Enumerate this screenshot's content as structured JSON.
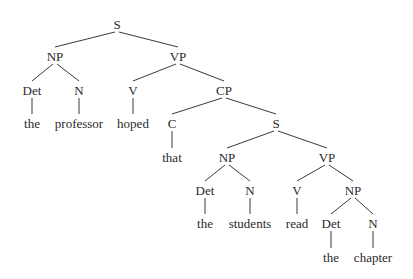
{
  "diagram": {
    "type": "syntax-tree",
    "sentence": "the professor hoped that the students read the chapter",
    "colors": {
      "text": "#2a2a2a",
      "edges": "#3a3a3a",
      "background": "#ffffff"
    },
    "nodes": [
      {
        "id": "S1",
        "label": "S",
        "x": 117,
        "y": 24
      },
      {
        "id": "NP1",
        "label": "NP",
        "x": 55,
        "y": 56
      },
      {
        "id": "VP1",
        "label": "VP",
        "x": 178,
        "y": 56
      },
      {
        "id": "Det1",
        "label": "Det",
        "x": 32,
        "y": 90
      },
      {
        "id": "N1",
        "label": "N",
        "x": 79,
        "y": 90
      },
      {
        "id": "V1",
        "label": "V",
        "x": 133,
        "y": 90
      },
      {
        "id": "CP1",
        "label": "CP",
        "x": 224,
        "y": 90
      },
      {
        "id": "w1",
        "label": "the",
        "x": 32,
        "y": 123
      },
      {
        "id": "w2",
        "label": "professor",
        "x": 79,
        "y": 123
      },
      {
        "id": "w3",
        "label": "hoped",
        "x": 133,
        "y": 123
      },
      {
        "id": "C1",
        "label": "C",
        "x": 172,
        "y": 123
      },
      {
        "id": "S2",
        "label": "S",
        "x": 276,
        "y": 123
      },
      {
        "id": "w4",
        "label": "that",
        "x": 172,
        "y": 157
      },
      {
        "id": "NP2",
        "label": "NP",
        "x": 227,
        "y": 157
      },
      {
        "id": "VP2",
        "label": "VP",
        "x": 327,
        "y": 157
      },
      {
        "id": "Det2",
        "label": "Det",
        "x": 205,
        "y": 190
      },
      {
        "id": "N2",
        "label": "N",
        "x": 250,
        "y": 190
      },
      {
        "id": "V2",
        "label": "V",
        "x": 297,
        "y": 190
      },
      {
        "id": "NP3",
        "label": "NP",
        "x": 353,
        "y": 190
      },
      {
        "id": "w5",
        "label": "the",
        "x": 205,
        "y": 223
      },
      {
        "id": "w6",
        "label": "students",
        "x": 250,
        "y": 223
      },
      {
        "id": "w7",
        "label": "read",
        "x": 297,
        "y": 223
      },
      {
        "id": "Det3",
        "label": "Det",
        "x": 331,
        "y": 223
      },
      {
        "id": "N3",
        "label": "N",
        "x": 373,
        "y": 223
      },
      {
        "id": "w8",
        "label": "the",
        "x": 331,
        "y": 257
      },
      {
        "id": "w9",
        "label": "chapter",
        "x": 373,
        "y": 257
      }
    ],
    "edges": [
      {
        "from": "S1",
        "to": "NP1",
        "kind": "branch"
      },
      {
        "from": "S1",
        "to": "VP1",
        "kind": "branch"
      },
      {
        "from": "NP1",
        "to": "Det1",
        "kind": "branch"
      },
      {
        "from": "NP1",
        "to": "N1",
        "kind": "branch"
      },
      {
        "from": "VP1",
        "to": "V1",
        "kind": "branch"
      },
      {
        "from": "VP1",
        "to": "CP1",
        "kind": "branch"
      },
      {
        "from": "Det1",
        "to": "w1",
        "kind": "stem"
      },
      {
        "from": "N1",
        "to": "w2",
        "kind": "stem"
      },
      {
        "from": "V1",
        "to": "w3",
        "kind": "stem"
      },
      {
        "from": "CP1",
        "to": "C1",
        "kind": "branch"
      },
      {
        "from": "CP1",
        "to": "S2",
        "kind": "branch"
      },
      {
        "from": "C1",
        "to": "w4",
        "kind": "stem"
      },
      {
        "from": "S2",
        "to": "NP2",
        "kind": "branch"
      },
      {
        "from": "S2",
        "to": "VP2",
        "kind": "branch"
      },
      {
        "from": "NP2",
        "to": "Det2",
        "kind": "branch"
      },
      {
        "from": "NP2",
        "to": "N2",
        "kind": "branch"
      },
      {
        "from": "VP2",
        "to": "V2",
        "kind": "branch"
      },
      {
        "from": "VP2",
        "to": "NP3",
        "kind": "branch"
      },
      {
        "from": "Det2",
        "to": "w5",
        "kind": "stem"
      },
      {
        "from": "N2",
        "to": "w6",
        "kind": "stem"
      },
      {
        "from": "V2",
        "to": "w7",
        "kind": "stem"
      },
      {
        "from": "NP3",
        "to": "Det3",
        "kind": "branch"
      },
      {
        "from": "NP3",
        "to": "N3",
        "kind": "branch"
      },
      {
        "from": "Det3",
        "to": "w8",
        "kind": "stem"
      },
      {
        "from": "N3",
        "to": "w9",
        "kind": "stem"
      }
    ]
  }
}
